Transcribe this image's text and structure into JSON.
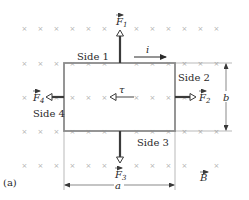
{
  "figure": {
    "panel_label": "(a)",
    "colors": {
      "loop": "#8a8a8a",
      "arrow": "#3a3a3a",
      "field_x": "#b0b0b0",
      "text": "#2a2a2a"
    },
    "field": {
      "symbol": "×",
      "label": "B",
      "direction": "into-page"
    },
    "loop": {
      "sides": [
        {
          "id": 1,
          "label": "Side 1"
        },
        {
          "id": 2,
          "label": "Side 2"
        },
        {
          "id": 3,
          "label": "Side 3"
        },
        {
          "id": 4,
          "label": "Side 4"
        }
      ]
    },
    "current": {
      "label": "i"
    },
    "torque": {
      "label": "τ"
    },
    "forces": [
      {
        "name": "F",
        "sub": "1"
      },
      {
        "name": "F",
        "sub": "2"
      },
      {
        "name": "F",
        "sub": "3"
      },
      {
        "name": "F",
        "sub": "4"
      }
    ],
    "dimensions": {
      "width": "a",
      "height": "b"
    }
  }
}
